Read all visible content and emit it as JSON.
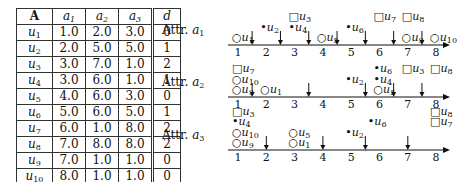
{
  "table": {
    "headers": [
      "A",
      "a1",
      "a2",
      "a3",
      "d"
    ],
    "rows": [
      {
        "u": "u1",
        "a1": "1.0",
        "a2": "2.0",
        "a3": "3.0",
        "d": "0"
      },
      {
        "u": "u2",
        "a1": "2.0",
        "a2": "5.0",
        "a3": "5.0",
        "d": "1"
      },
      {
        "u": "u3",
        "a1": "3.0",
        "a2": "7.0",
        "a3": "1.0",
        "d": "2"
      },
      {
        "u": "u4",
        "a1": "3.0",
        "a2": "6.0",
        "a3": "1.0",
        "d": "1"
      },
      {
        "u": "u5",
        "a1": "4.0",
        "a2": "6.0",
        "a3": "3.0",
        "d": "0"
      },
      {
        "u": "u6",
        "a1": "5.0",
        "a2": "6.0",
        "a3": "5.0",
        "d": "1"
      },
      {
        "u": "u7",
        "a1": "6.0",
        "a2": "1.0",
        "a3": "8.0",
        "d": "2"
      },
      {
        "u": "u8",
        "a1": "7.0",
        "a2": "8.0",
        "a3": "8.0",
        "d": "2"
      },
      {
        "u": "u9",
        "a1": "7.0",
        "a2": "1.0",
        "a3": "1.0",
        "d": "0"
      },
      {
        "u": "u10",
        "a1": "8.0",
        "a2": "1.0",
        "a3": "1.0",
        "d": "0"
      }
    ]
  },
  "axes": [
    {
      "label": "Attr. a1",
      "ticks": [
        "1",
        "2",
        "3",
        "4",
        "5",
        "6",
        "7",
        "8"
      ],
      "cuts": [
        1.5,
        2.5,
        3.5,
        4.5,
        5.5,
        6.5,
        7.5
      ],
      "points": [
        {
          "name": "u1",
          "value": 1,
          "class": 0,
          "stack": 0
        },
        {
          "name": "u2",
          "value": 2,
          "class": 1,
          "stack": 1
        },
        {
          "name": "u4",
          "value": 3,
          "class": 1,
          "stack": 1
        },
        {
          "name": "u3",
          "value": 3,
          "class": 2,
          "stack": 2
        },
        {
          "name": "u5",
          "value": 4,
          "class": 0,
          "stack": 0
        },
        {
          "name": "u6",
          "value": 5,
          "class": 1,
          "stack": 1
        },
        {
          "name": "u7",
          "value": 6,
          "class": 2,
          "stack": 2
        },
        {
          "name": "u9",
          "value": 7,
          "class": 0,
          "stack": 0
        },
        {
          "name": "u8",
          "value": 7,
          "class": 2,
          "stack": 2
        },
        {
          "name": "u10",
          "value": 8,
          "class": 0,
          "stack": 0
        }
      ]
    },
    {
      "label": "Attr. a2",
      "ticks": [
        "1",
        "2",
        "3",
        "4",
        "5",
        "6",
        "7",
        "8"
      ],
      "cuts": [
        1.5,
        3.5,
        5.5,
        6.5,
        7.5
      ],
      "points": [
        {
          "name": "u9",
          "value": 1,
          "class": 0,
          "stack": 0
        },
        {
          "name": "u10",
          "value": 1,
          "class": 0,
          "stack": 1
        },
        {
          "name": "u7",
          "value": 1,
          "class": 2,
          "stack": 2
        },
        {
          "name": "u1",
          "value": 2,
          "class": 0,
          "stack": 0
        },
        {
          "name": "u2",
          "value": 5,
          "class": 1,
          "stack": 1
        },
        {
          "name": "u5",
          "value": 6,
          "class": 0,
          "stack": 0
        },
        {
          "name": "u4",
          "value": 6,
          "class": 1,
          "stack": 1
        },
        {
          "name": "u6",
          "value": 6,
          "class": 1,
          "stack": 2
        },
        {
          "name": "u3",
          "value": 7,
          "class": 2,
          "stack": 2
        },
        {
          "name": "u8",
          "value": 8,
          "class": 2,
          "stack": 2
        }
      ]
    },
    {
      "label": "Attr. a3",
      "ticks": [
        "1",
        "2",
        "3",
        "4",
        "5",
        "6",
        "7",
        "8"
      ],
      "cuts": [
        2,
        4,
        5.5,
        7
      ],
      "points": [
        {
          "name": "u9",
          "value": 1,
          "class": 0,
          "stack": 0
        },
        {
          "name": "u10",
          "value": 1,
          "class": 0,
          "stack": 1
        },
        {
          "name": "u4",
          "value": 1,
          "class": 1,
          "stack": 2
        },
        {
          "name": "u3",
          "value": 1,
          "class": 2,
          "stack": 3
        },
        {
          "name": "u1",
          "value": 3,
          "class": 0,
          "stack": 0
        },
        {
          "name": "u5",
          "value": 3,
          "class": 0,
          "stack": 1
        },
        {
          "name": "u2",
          "value": 5,
          "class": 1,
          "stack": 1
        },
        {
          "name": "u6",
          "value": 5.8,
          "class": 1,
          "stack": 2
        },
        {
          "name": "u7",
          "value": 8,
          "class": 2,
          "stack": 2
        },
        {
          "name": "u8",
          "value": 8,
          "class": 2,
          "stack": 3
        }
      ]
    }
  ],
  "legend_markers": {
    "0": "○",
    "1": "•",
    "2": "□"
  }
}
